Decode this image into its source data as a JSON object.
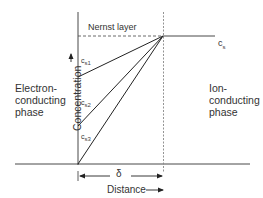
{
  "diagram": {
    "nernst_label": "Nernst layer",
    "bulk_label": "c",
    "bulk_sub": "s",
    "profiles": [
      {
        "label": "c",
        "sub": "s1"
      },
      {
        "label": "c",
        "sub": "s2"
      },
      {
        "label": "c",
        "sub": "s3"
      }
    ],
    "left_phase": [
      "Electron-",
      "conducting",
      "phase"
    ],
    "right_phase": [
      "Ion-",
      "conducting",
      "phase"
    ],
    "y_axis_label": "Concentration",
    "thickness_label": "δ",
    "x_axis_label": "Distance"
  }
}
